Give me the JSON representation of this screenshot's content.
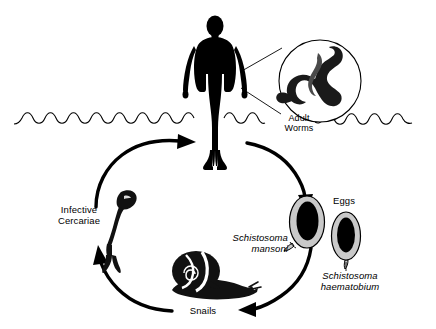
{
  "diagram": {
    "colors": {
      "ink": "#000000",
      "background": "#ffffff",
      "egg_shell": "#c9c9c9",
      "egg_core": "#000000"
    },
    "labels": {
      "adult_worms": "Adult\nWorms",
      "infective_cercariae": "Infective\nCercariae",
      "eggs": "Eggs",
      "schistosoma_mansoni": "Schistosoma\nmansoni",
      "schistosoma_haematobium": "Schistosoma\nhaematobium",
      "snails": "Snails"
    },
    "stages": [
      {
        "id": "human-host",
        "name": "Human host standing in water"
      },
      {
        "id": "adult-worms",
        "name": "Adult worms in magnified inset circle"
      },
      {
        "id": "eggs",
        "name": "Eggs of two species"
      },
      {
        "id": "snails",
        "name": "Snail intermediate host"
      },
      {
        "id": "cercariae",
        "name": "Infective cercariae"
      }
    ],
    "arrows": [
      {
        "id": "human-to-eggs",
        "from": "human-host",
        "to": "eggs"
      },
      {
        "id": "eggs-to-snails",
        "from": "eggs",
        "to": "snails"
      },
      {
        "id": "snails-to-cercariae",
        "from": "snails",
        "to": "cercariae"
      },
      {
        "id": "cercariae-to-human",
        "from": "cercariae",
        "to": "human-host"
      }
    ]
  }
}
